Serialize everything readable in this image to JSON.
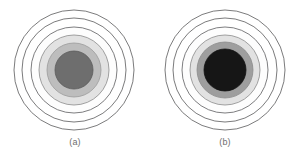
{
  "document": {
    "type": "figure-pair",
    "background_color": "#ffffff",
    "description": "Two side-by-side concentric ring patterns"
  },
  "figures": [
    {
      "id": "a",
      "caption": "(a)",
      "center_x": 69,
      "center_y": 66,
      "rings": [
        {
          "name": "outer-ring-6",
          "r": 60,
          "fill": "#ffffff",
          "stroke": "#59595b",
          "stroke_width": 0.8
        },
        {
          "name": "ring-5",
          "r": 52,
          "fill": "#ffffff",
          "stroke": "#59595b",
          "stroke_width": 0.8
        },
        {
          "name": "ring-4",
          "r": 43,
          "fill": "#fdfdfd",
          "stroke": "#5d5d5f",
          "stroke_width": 0.8
        },
        {
          "name": "ring-3-light-gray",
          "r": 35,
          "fill": "#e2e2e2",
          "stroke": "#8a8a8a",
          "stroke_width": 0.8
        },
        {
          "name": "ring-2-mid-gray",
          "r": 27,
          "fill": "#bdbdbd",
          "stroke": "#9a9a9a",
          "stroke_width": 0.8
        },
        {
          "name": "core-disc",
          "r": 19,
          "fill": "#6e6e6e",
          "stroke": "#5a5a5a",
          "stroke_width": 0.8
        }
      ]
    },
    {
      "id": "b",
      "caption": "(b)",
      "center_x": 70,
      "center_y": 66,
      "rings": [
        {
          "name": "outer-ring-6",
          "r": 60,
          "fill": "#ffffff",
          "stroke": "#59595b",
          "stroke_width": 0.8
        },
        {
          "name": "ring-5",
          "r": 52,
          "fill": "#ffffff",
          "stroke": "#59595b",
          "stroke_width": 0.8
        },
        {
          "name": "ring-4",
          "r": 43,
          "fill": "#fdfdfd",
          "stroke": "#5d5d5f",
          "stroke_width": 0.8
        },
        {
          "name": "ring-3-light-gray",
          "r": 35,
          "fill": "#e2e2e2",
          "stroke": "#8a8a8a",
          "stroke_width": 0.8
        },
        {
          "name": "ring-2-mid-gray",
          "r": 28,
          "fill": "#9e9e9e",
          "stroke": "#8c8c8c",
          "stroke_width": 0.8
        },
        {
          "name": "core-disc",
          "r": 21,
          "fill": "#161616",
          "stroke": "#121212",
          "stroke_width": 0.8
        }
      ]
    }
  ],
  "colors": {
    "background": "#ffffff",
    "outline": "#59595b",
    "light_gray_band": "#e2e2e2",
    "mid_gray_band": "#bdbdbd",
    "core_gray": "#6e6e6e",
    "core_black": "#161616",
    "caption_text": "#6e6e6e"
  }
}
